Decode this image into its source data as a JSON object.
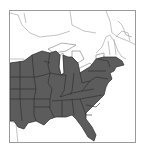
{
  "map": {
    "title": "Eastern United States range map",
    "range_region": "Eastern United States",
    "shaded_states": [
      "Texas (east)",
      "Oklahoma (east)",
      "Kansas (east)",
      "Nebraska (east)",
      "South Dakota (east)",
      "Minnesota",
      "Iowa",
      "Missouri",
      "Arkansas",
      "Louisiana",
      "Wisconsin",
      "Illinois",
      "Michigan",
      "Indiana",
      "Ohio",
      "Kentucky",
      "Tennessee",
      "Mississippi",
      "Alabama",
      "Georgia",
      "Florida",
      "South Carolina",
      "North Carolina",
      "Virginia",
      "West Virginia",
      "Maryland",
      "Delaware",
      "Pennsylvania",
      "New Jersey",
      "New York",
      "Connecticut",
      "Rhode Island",
      "Massachusetts"
    ],
    "colors": {
      "range_fill": "#5c5c5c",
      "border": "#2a2a2a",
      "outline": "#8a8a8a",
      "background": "#ffffff"
    }
  }
}
